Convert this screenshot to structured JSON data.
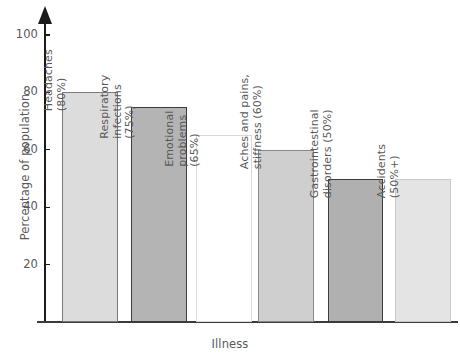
{
  "chart_data": {
    "type": "bar",
    "title": "",
    "xlabel": "Illness",
    "ylabel": "Percentage of population",
    "ylim": [
      0,
      108
    ],
    "grid": false,
    "legend": "none",
    "yticks": [
      20,
      40,
      60,
      80,
      100
    ],
    "ytick_labels": [
      "20",
      "40",
      "60",
      "80",
      "100"
    ],
    "categories": [
      "Headaches",
      "Respiratory infections",
      "Emotional problems",
      "Aches and pains, stiffness",
      "Gastrointestinal disorders",
      "Accidents"
    ],
    "values": [
      80,
      75,
      65,
      60,
      50,
      50
    ],
    "value_labels": [
      "(80%)",
      "(75%)",
      "(65%)",
      "(60%)",
      "(50%)",
      "(50%+)"
    ],
    "bar_labels": [
      "Headaches\n(80%)",
      "Respiratory\ninfections\n(75%)",
      "Emotional\nproblems\n(65%)",
      "Aches and pains,\nstiffness (60%)",
      "Gastrointestinal\ndisorders (50%)",
      "Accidents\n(50%+)"
    ],
    "bar_fills": [
      "#dcdcdc",
      "#b4b4b4",
      "#ffffff",
      "#cfcfcf",
      "#b0b0b0",
      "#e4e4e4"
    ],
    "bar_strokes": [
      "#7a7a7a",
      "#3c3c3c",
      "#d8d8d8",
      "#8a8a8a",
      "#3c3c3c",
      "#c9c9c9"
    ]
  },
  "axis": {
    "y_title": "Percentage of population",
    "x_title": "Illness",
    "ticks": [
      {
        "label": "100"
      },
      {
        "label": "80"
      },
      {
        "label": "60"
      },
      {
        "label": "40"
      },
      {
        "label": "20"
      }
    ]
  },
  "bars": [
    {
      "label_line1": "Headaches",
      "label_line2": "(80%)",
      "label_line3": ""
    },
    {
      "label_line1": "Respiratory",
      "label_line2": "infections",
      "label_line3": "(75%)"
    },
    {
      "label_line1": "Emotional",
      "label_line2": "problems",
      "label_line3": "(65%)"
    },
    {
      "label_line1": "Aches and pains,",
      "label_line2": "stiffness (60%)",
      "label_line3": ""
    },
    {
      "label_line1": "Gastrointestinal",
      "label_line2": "disorders (50%)",
      "label_line3": ""
    },
    {
      "label_line1": "Accidents",
      "label_line2": "(50%+)",
      "label_line3": ""
    }
  ]
}
